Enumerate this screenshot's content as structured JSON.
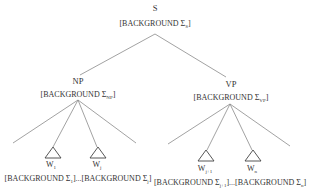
{
  "diagram": {
    "type": "syntax-tree",
    "root": {
      "label": "S",
      "feature_prefix": "[BACKGROUND Σ",
      "feature_sub": "S",
      "feature_suffix": "]"
    },
    "np": {
      "label": "NP",
      "feature_prefix": "[BACKGROUND Σ",
      "feature_sub": "NP",
      "feature_suffix": "]",
      "leaves": [
        {
          "word": "W",
          "sub": "1"
        },
        {
          "word": "W",
          "sub": "j"
        }
      ],
      "leaf_features": {
        "first_prefix": "[BACKGROUND Σ",
        "first_sub": "1",
        "middle": "]...[BACKGROUND Σ",
        "last_sub": "j",
        "suffix": "]"
      }
    },
    "vp": {
      "label": "VP",
      "feature_prefix": "[BACKGROUND Σ",
      "feature_sub": "VP",
      "feature_suffix": "]",
      "leaves": [
        {
          "word": "W",
          "sub": "j+1"
        },
        {
          "word": "W",
          "sub": "n"
        }
      ],
      "leaf_features": {
        "first_prefix": "[BACKGROUND Σ",
        "first_sub": "j+1",
        "middle": "]...[BACKGROUND Σ",
        "last_sub": "n",
        "suffix": "]"
      }
    }
  }
}
